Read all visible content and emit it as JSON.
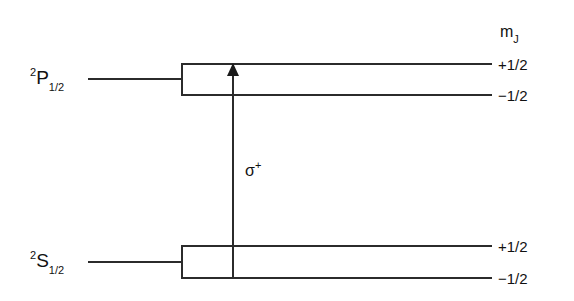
{
  "diagram": {
    "title_label": "m",
    "mj_header": {
      "symbol": "m",
      "subscript": "J"
    },
    "levels": [
      {
        "id": "upper",
        "term": {
          "superscript": "2",
          "letter": "P",
          "subscript": "1/2"
        },
        "sublevels": [
          {
            "mj": "+1/2"
          },
          {
            "mj": "−1/2"
          }
        ]
      },
      {
        "id": "lower",
        "term": {
          "superscript": "2",
          "letter": "S",
          "subscript": "1/2"
        },
        "sublevels": [
          {
            "mj": "+1/2"
          },
          {
            "mj": "−1/2"
          }
        ]
      }
    ],
    "transition": {
      "polarization_symbol": "σ",
      "polarization_charge": "+",
      "direction": "up"
    },
    "colors": {
      "background": "#ffffff",
      "line": "#2b2b2b",
      "text": "#111111",
      "arrow": "#1a1a1a"
    }
  }
}
